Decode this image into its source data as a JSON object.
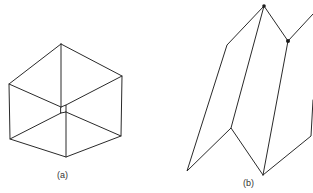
{
  "figure_a": {
    "caption": "(a)",
    "description": "Isometric wireframe cube (hexagonal outline) with three inner edges meeting at a small central square",
    "vertices": {
      "top": [
        61,
        44
      ],
      "upper_left": [
        9,
        84
      ],
      "upper_right": [
        122,
        76
      ],
      "lower_left": [
        10,
        139
      ],
      "lower_right": [
        121,
        136
      ],
      "bottom": [
        66,
        157
      ],
      "center_tl": [
        61,
        107
      ],
      "center_tr": [
        66,
        105
      ],
      "center_bl": [
        61,
        113
      ],
      "center_br": [
        66,
        112
      ]
    }
  },
  "figure_b": {
    "caption": "(b)",
    "description": "Folded zig-zag surface wireframe with two marked vertices",
    "vertices": {
      "peak": [
        264,
        6
      ],
      "upper_left_kink": [
        227,
        45
      ],
      "bottom_left": [
        187,
        171
      ],
      "mid_kink": [
        231,
        128
      ],
      "bottom": [
        263,
        175
      ],
      "dot_vertex": [
        288,
        41
      ],
      "upper_right_end": [
        313,
        14
      ],
      "right_kink": [
        311,
        136
      ],
      "right_upper_end": [
        313,
        100
      ]
    },
    "marked_vertices": [
      "peak",
      "dot_vertex"
    ]
  },
  "colors": {
    "line": "#2a2a2a",
    "background": "#ffffff"
  }
}
